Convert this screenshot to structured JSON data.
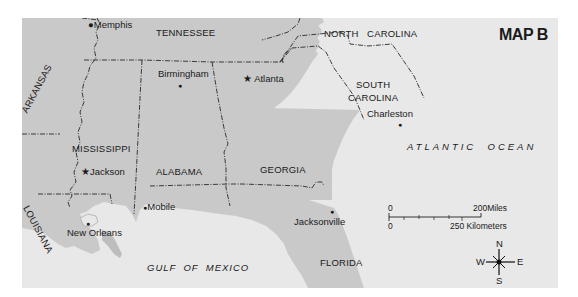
{
  "map": {
    "title": "MAP B",
    "colors": {
      "land": "#c9c9c9",
      "water": "#e8e8e8",
      "border": "#2a2a2a",
      "page": "#ffffff"
    },
    "states": [
      {
        "id": "tennessee",
        "label": "TENNESSEE"
      },
      {
        "id": "north-carolina",
        "label": "NORTH   CAROLINA"
      },
      {
        "id": "arkansas",
        "label": "ARKANSAS"
      },
      {
        "id": "south-carolina-1",
        "label": "SOUTH"
      },
      {
        "id": "south-carolina-2",
        "label": "CAROLINA"
      },
      {
        "id": "mississippi",
        "label": "MISSISSIPPI"
      },
      {
        "id": "alabama",
        "label": "ALABAMA"
      },
      {
        "id": "georgia",
        "label": "GEORGIA"
      },
      {
        "id": "louisiana",
        "label": "LOUISIANA"
      },
      {
        "id": "florida",
        "label": "FLORIDA"
      }
    ],
    "cities": [
      {
        "id": "memphis",
        "label": "Memphis",
        "marker": "dot"
      },
      {
        "id": "birmingham",
        "label": "Birmingham",
        "marker": "dot"
      },
      {
        "id": "atlanta",
        "label": "Atlanta",
        "marker": "star"
      },
      {
        "id": "charleston",
        "label": "Charleston",
        "marker": "dot"
      },
      {
        "id": "jackson",
        "label": "Jackson",
        "marker": "star"
      },
      {
        "id": "mobile",
        "label": "Mobile",
        "marker": "dot"
      },
      {
        "id": "new-orleans",
        "label": "New Orleans",
        "marker": "dot"
      },
      {
        "id": "jacksonville",
        "label": "Jacksonville",
        "marker": "dot"
      }
    ],
    "water_bodies": [
      {
        "id": "atlantic",
        "label": "ATLANTIC  OCEAN"
      },
      {
        "id": "gulf",
        "label": "GULF  OF  MEXICO"
      }
    ],
    "scale": {
      "miles_zero": "0",
      "miles_max": "200",
      "miles_unit": "Miles",
      "km_zero": "0",
      "km_max": "250",
      "km_unit": "Kilometers"
    },
    "compass": {
      "n": "N",
      "s": "S",
      "e": "E",
      "w": "W"
    }
  }
}
